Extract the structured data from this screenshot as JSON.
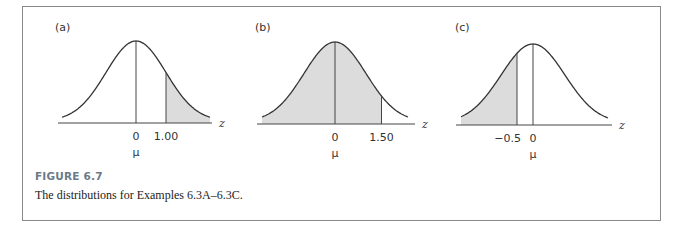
{
  "figure": {
    "title": "FIGURE 6.7",
    "caption": "The distributions for Examples 6.3A–6.3C."
  },
  "chart_data": [
    {
      "type": "area",
      "panel_label": "(a)",
      "description": "Standard normal curve, shaded area to the right of z = 1.00",
      "xlabel": "z",
      "tick_labels": [
        "0",
        "1.00"
      ],
      "tick_values": [
        0,
        1.0
      ],
      "mean_label": "μ",
      "shaded_region": {
        "from": 1.0,
        "to": "inf"
      },
      "xlim": [
        -3,
        3
      ]
    },
    {
      "type": "area",
      "panel_label": "(b)",
      "description": "Standard normal curve, shaded area to the left of z = 1.50",
      "xlabel": "z",
      "tick_labels": [
        "0",
        "1.50"
      ],
      "tick_values": [
        0,
        1.5
      ],
      "mean_label": "μ",
      "shaded_region": {
        "from": "-inf",
        "to": 1.5
      },
      "xlim": [
        -3,
        3
      ]
    },
    {
      "type": "area",
      "panel_label": "(c)",
      "description": "Standard normal curve, shaded area to the left of z = -0.5",
      "xlabel": "z",
      "tick_labels": [
        "−0.5",
        "0"
      ],
      "tick_values": [
        -0.5,
        0
      ],
      "mean_label": "μ",
      "shaded_region": {
        "from": "-inf",
        "to": -0.5
      },
      "xlim": [
        -3,
        3
      ]
    }
  ],
  "colors": {
    "shade": "#dcdcdc",
    "curve": "#333333",
    "border": "#8a8a8a",
    "caption_title": "#6a7a8a"
  }
}
